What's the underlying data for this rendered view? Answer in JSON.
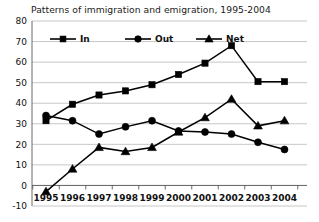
{
  "chart_data": {
    "type": "line",
    "title": "Patterns of immigration and emigration, 1995-2004",
    "xlabel": "",
    "ylabel": "",
    "categories": [
      "1995",
      "1996",
      "1997",
      "1998",
      "1999",
      "2000",
      "2001",
      "2002",
      "2003",
      "2004"
    ],
    "x": [
      1995,
      1996,
      1997,
      1998,
      1999,
      2000,
      2001,
      2002,
      2003,
      2004
    ],
    "series": [
      {
        "name": "In",
        "marker": "square",
        "values": [
          31.5,
          39.5,
          44,
          46,
          49,
          54,
          59.5,
          68,
          50.5,
          50.5
        ]
      },
      {
        "name": "Out",
        "marker": "circle",
        "values": [
          34,
          31.5,
          25,
          28.5,
          31.5,
          26.5,
          26,
          25,
          21,
          17.5
        ]
      },
      {
        "name": "Net",
        "marker": "triangle",
        "values": [
          -3,
          8,
          18.5,
          16.5,
          18.5,
          26,
          33,
          42,
          29,
          31.5
        ]
      }
    ],
    "ylim": [
      -10,
      80
    ],
    "ytick_labels": [
      "-10",
      "0",
      "10",
      "20",
      "30",
      "40",
      "50",
      "60",
      "70",
      "80"
    ],
    "ytick_values": [
      -10,
      0,
      10,
      20,
      30,
      40,
      50,
      60,
      70,
      80
    ],
    "grid": true,
    "legend_position": "top-left-inside",
    "legend_entries": [
      "In",
      "Out",
      "Net"
    ],
    "colors": {
      "series": "#000000",
      "grid": "#b9b9b9",
      "axis": "#5a5a5a",
      "background": "#ffffff",
      "text": "#111111"
    }
  }
}
